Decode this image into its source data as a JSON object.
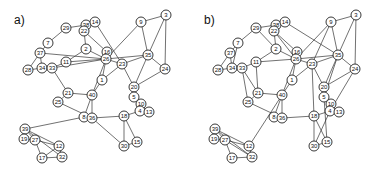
{
  "figure": {
    "panels": [
      {
        "label": "a)",
        "label_pos": [
          14,
          24
        ],
        "offset": [
          0,
          0
        ],
        "nodes": [
          {
            "id": "3",
            "x": 166,
            "y": 15
          },
          {
            "id": "9",
            "x": 141,
            "y": 22
          },
          {
            "id": "29",
            "x": 66,
            "y": 28
          },
          {
            "id": "38",
            "x": 86,
            "y": 25
          },
          {
            "id": "14",
            "x": 95,
            "y": 22
          },
          {
            "id": "22",
            "x": 84,
            "y": 31
          },
          {
            "id": "7",
            "x": 48,
            "y": 43
          },
          {
            "id": "37",
            "x": 40,
            "y": 53
          },
          {
            "id": "2",
            "x": 86,
            "y": 49
          },
          {
            "id": "16",
            "x": 107,
            "y": 52
          },
          {
            "id": "26",
            "x": 106,
            "y": 59
          },
          {
            "id": "35",
            "x": 148,
            "y": 55
          },
          {
            "id": "11",
            "x": 66,
            "y": 62
          },
          {
            "id": "28",
            "x": 28,
            "y": 70
          },
          {
            "id": "34",
            "x": 42,
            "y": 68
          },
          {
            "id": "33",
            "x": 52,
            "y": 68
          },
          {
            "id": "23",
            "x": 122,
            "y": 64
          },
          {
            "id": "24",
            "x": 165,
            "y": 69
          },
          {
            "id": "1",
            "x": 102,
            "y": 80
          },
          {
            "id": "21",
            "x": 68,
            "y": 93
          },
          {
            "id": "40",
            "x": 92,
            "y": 95
          },
          {
            "id": "20",
            "x": 134,
            "y": 87
          },
          {
            "id": "25",
            "x": 58,
            "y": 102
          },
          {
            "id": "5",
            "x": 134,
            "y": 97
          },
          {
            "id": "10",
            "x": 141,
            "y": 104
          },
          {
            "id": "4",
            "x": 140,
            "y": 111
          },
          {
            "id": "13",
            "x": 149,
            "y": 112
          },
          {
            "id": "8",
            "x": 84,
            "y": 117
          },
          {
            "id": "36",
            "x": 92,
            "y": 118
          },
          {
            "id": "18",
            "x": 124,
            "y": 116
          },
          {
            "id": "39",
            "x": 25,
            "y": 129
          },
          {
            "id": "19",
            "x": 24,
            "y": 139
          },
          {
            "id": "27",
            "x": 35,
            "y": 140
          },
          {
            "id": "12",
            "x": 59,
            "y": 146
          },
          {
            "id": "30",
            "x": 124,
            "y": 146
          },
          {
            "id": "15",
            "x": 137,
            "y": 142
          },
          {
            "id": "17",
            "x": 42,
            "y": 158
          },
          {
            "id": "32",
            "x": 62,
            "y": 157
          }
        ],
        "edges": [
          [
            "3",
            "9"
          ],
          [
            "3",
            "35"
          ],
          [
            "3",
            "24"
          ],
          [
            "9",
            "26"
          ],
          [
            "9",
            "35"
          ],
          [
            "29",
            "38"
          ],
          [
            "29",
            "7"
          ],
          [
            "38",
            "14"
          ],
          [
            "38",
            "22"
          ],
          [
            "14",
            "22"
          ],
          [
            "14",
            "23"
          ],
          [
            "22",
            "2"
          ],
          [
            "22",
            "16"
          ],
          [
            "7",
            "37"
          ],
          [
            "37",
            "34"
          ],
          [
            "37",
            "28"
          ],
          [
            "37",
            "26"
          ],
          [
            "2",
            "11"
          ],
          [
            "2",
            "26"
          ],
          [
            "16",
            "26"
          ],
          [
            "26",
            "35"
          ],
          [
            "26",
            "23"
          ],
          [
            "26",
            "11"
          ],
          [
            "26",
            "1"
          ],
          [
            "35",
            "23"
          ],
          [
            "35",
            "24"
          ],
          [
            "35",
            "20"
          ],
          [
            "11",
            "33"
          ],
          [
            "34",
            "33"
          ],
          [
            "28",
            "34"
          ],
          [
            "33",
            "26"
          ],
          [
            "33",
            "21"
          ],
          [
            "23",
            "20"
          ],
          [
            "23",
            "1"
          ],
          [
            "24",
            "20"
          ],
          [
            "1",
            "40"
          ],
          [
            "21",
            "40"
          ],
          [
            "21",
            "25"
          ],
          [
            "40",
            "8"
          ],
          [
            "40",
            "36"
          ],
          [
            "26",
            "40"
          ],
          [
            "20",
            "5"
          ],
          [
            "5",
            "10"
          ],
          [
            "10",
            "4"
          ],
          [
            "4",
            "13"
          ],
          [
            "10",
            "13"
          ],
          [
            "4",
            "18"
          ],
          [
            "25",
            "36"
          ],
          [
            "8",
            "36"
          ],
          [
            "36",
            "18"
          ],
          [
            "36",
            "30"
          ],
          [
            "18",
            "30"
          ],
          [
            "18",
            "15"
          ],
          [
            "30",
            "15"
          ],
          [
            "39",
            "8"
          ],
          [
            "39",
            "19"
          ],
          [
            "39",
            "27"
          ],
          [
            "39",
            "12"
          ],
          [
            "39",
            "32"
          ],
          [
            "19",
            "27"
          ],
          [
            "27",
            "12"
          ],
          [
            "27",
            "17"
          ],
          [
            "12",
            "32"
          ],
          [
            "17",
            "32"
          ],
          [
            "17",
            "12"
          ]
        ]
      },
      {
        "label": "b)",
        "label_pos": [
          204,
          24
        ],
        "offset": [
          190,
          0
        ],
        "nodes": [
          {
            "id": "3",
            "x": 166,
            "y": 15
          },
          {
            "id": "9",
            "x": 141,
            "y": 22
          },
          {
            "id": "29",
            "x": 66,
            "y": 28
          },
          {
            "id": "38",
            "x": 86,
            "y": 25
          },
          {
            "id": "14",
            "x": 95,
            "y": 22
          },
          {
            "id": "22",
            "x": 84,
            "y": 31
          },
          {
            "id": "7",
            "x": 48,
            "y": 43
          },
          {
            "id": "37",
            "x": 40,
            "y": 53
          },
          {
            "id": "2",
            "x": 86,
            "y": 49
          },
          {
            "id": "16",
            "x": 107,
            "y": 52
          },
          {
            "id": "26",
            "x": 106,
            "y": 59
          },
          {
            "id": "35",
            "x": 148,
            "y": 55
          },
          {
            "id": "11",
            "x": 66,
            "y": 62
          },
          {
            "id": "28",
            "x": 28,
            "y": 70
          },
          {
            "id": "34",
            "x": 42,
            "y": 68
          },
          {
            "id": "33",
            "x": 52,
            "y": 68
          },
          {
            "id": "23",
            "x": 122,
            "y": 64
          },
          {
            "id": "24",
            "x": 165,
            "y": 69
          },
          {
            "id": "1",
            "x": 102,
            "y": 80
          },
          {
            "id": "21",
            "x": 68,
            "y": 93
          },
          {
            "id": "40",
            "x": 92,
            "y": 95
          },
          {
            "id": "20",
            "x": 134,
            "y": 87
          },
          {
            "id": "25",
            "x": 58,
            "y": 102
          },
          {
            "id": "5",
            "x": 134,
            "y": 97
          },
          {
            "id": "10",
            "x": 141,
            "y": 104
          },
          {
            "id": "4",
            "x": 140,
            "y": 111
          },
          {
            "id": "13",
            "x": 149,
            "y": 112
          },
          {
            "id": "8",
            "x": 84,
            "y": 117
          },
          {
            "id": "36",
            "x": 92,
            "y": 118
          },
          {
            "id": "18",
            "x": 124,
            "y": 116
          },
          {
            "id": "39",
            "x": 25,
            "y": 129
          },
          {
            "id": "19",
            "x": 24,
            "y": 139
          },
          {
            "id": "27",
            "x": 35,
            "y": 140
          },
          {
            "id": "12",
            "x": 59,
            "y": 146
          },
          {
            "id": "30",
            "x": 124,
            "y": 146
          },
          {
            "id": "15",
            "x": 137,
            "y": 142
          },
          {
            "id": "17",
            "x": 42,
            "y": 158
          },
          {
            "id": "32",
            "x": 62,
            "y": 157
          }
        ],
        "edges": [
          [
            "3",
            "9"
          ],
          [
            "3",
            "35"
          ],
          [
            "3",
            "24"
          ],
          [
            "9",
            "26"
          ],
          [
            "9",
            "35"
          ],
          [
            "9",
            "23"
          ],
          [
            "29",
            "38"
          ],
          [
            "29",
            "7"
          ],
          [
            "29",
            "2"
          ],
          [
            "38",
            "14"
          ],
          [
            "38",
            "22"
          ],
          [
            "14",
            "22"
          ],
          [
            "14",
            "35"
          ],
          [
            "22",
            "2"
          ],
          [
            "22",
            "16"
          ],
          [
            "22",
            "26"
          ],
          [
            "7",
            "37"
          ],
          [
            "7",
            "34"
          ],
          [
            "37",
            "34"
          ],
          [
            "37",
            "28"
          ],
          [
            "2",
            "11"
          ],
          [
            "2",
            "26"
          ],
          [
            "16",
            "26"
          ],
          [
            "26",
            "35"
          ],
          [
            "26",
            "23"
          ],
          [
            "26",
            "11"
          ],
          [
            "26",
            "1"
          ],
          [
            "26",
            "40"
          ],
          [
            "35",
            "23"
          ],
          [
            "35",
            "24"
          ],
          [
            "35",
            "20"
          ],
          [
            "35",
            "5"
          ],
          [
            "11",
            "33"
          ],
          [
            "11",
            "21"
          ],
          [
            "34",
            "33"
          ],
          [
            "28",
            "34"
          ],
          [
            "33",
            "21"
          ],
          [
            "33",
            "25"
          ],
          [
            "23",
            "20"
          ],
          [
            "23",
            "1"
          ],
          [
            "23",
            "18"
          ],
          [
            "24",
            "20"
          ],
          [
            "24",
            "4"
          ],
          [
            "1",
            "40"
          ],
          [
            "21",
            "40"
          ],
          [
            "21",
            "25"
          ],
          [
            "40",
            "8"
          ],
          [
            "40",
            "36"
          ],
          [
            "20",
            "5"
          ],
          [
            "5",
            "10"
          ],
          [
            "10",
            "4"
          ],
          [
            "4",
            "13"
          ],
          [
            "10",
            "13"
          ],
          [
            "4",
            "18"
          ],
          [
            "4",
            "30"
          ],
          [
            "25",
            "36"
          ],
          [
            "8",
            "36"
          ],
          [
            "36",
            "18"
          ],
          [
            "18",
            "30"
          ],
          [
            "18",
            "15"
          ],
          [
            "5",
            "15"
          ],
          [
            "30",
            "15"
          ],
          [
            "39",
            "19"
          ],
          [
            "39",
            "27"
          ],
          [
            "39",
            "12"
          ],
          [
            "39",
            "32"
          ],
          [
            "19",
            "27"
          ],
          [
            "27",
            "12"
          ],
          [
            "27",
            "17"
          ],
          [
            "27",
            "32"
          ],
          [
            "12",
            "32"
          ],
          [
            "17",
            "32"
          ],
          [
            "12",
            "40"
          ]
        ]
      }
    ]
  }
}
